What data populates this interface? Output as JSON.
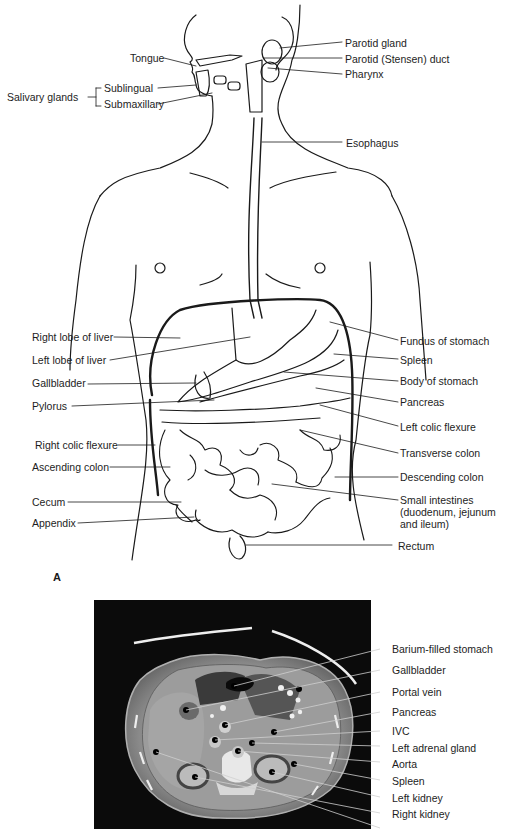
{
  "figure": {
    "panel_a": {
      "letter": "A",
      "left_labels": [
        {
          "id": "tongue",
          "text": "Tongue"
        },
        {
          "id": "salivary-glands",
          "text": "Salivary glands"
        },
        {
          "id": "sublingual",
          "text": "Sublingual"
        },
        {
          "id": "submaxillary",
          "text": "Submaxillary"
        },
        {
          "id": "right-lobe-liver",
          "text": "Right lobe of liver"
        },
        {
          "id": "left-lobe-liver",
          "text": "Left lobe of liver"
        },
        {
          "id": "gallbladder",
          "text": "Gallbladder"
        },
        {
          "id": "pylorus",
          "text": "Pylorus"
        },
        {
          "id": "right-colic-flexure",
          "text": "Right colic flexure"
        },
        {
          "id": "ascending-colon",
          "text": "Ascending colon"
        },
        {
          "id": "cecum",
          "text": "Cecum"
        },
        {
          "id": "appendix",
          "text": "Appendix"
        }
      ],
      "right_labels": [
        {
          "id": "parotid-gland",
          "text": "Parotid gland"
        },
        {
          "id": "parotid-duct",
          "text": "Parotid (Stensen) duct"
        },
        {
          "id": "pharynx",
          "text": "Pharynx"
        },
        {
          "id": "esophagus",
          "text": "Esophagus"
        },
        {
          "id": "fundus-stomach",
          "text": "Fundus of stomach"
        },
        {
          "id": "spleen",
          "text": "Spleen"
        },
        {
          "id": "body-stomach",
          "text": "Body of stomach"
        },
        {
          "id": "pancreas",
          "text": "Pancreas"
        },
        {
          "id": "left-colic-flexure",
          "text": "Left colic flexure"
        },
        {
          "id": "transverse-colon",
          "text": "Transverse colon"
        },
        {
          "id": "descending-colon",
          "text": "Descending colon"
        },
        {
          "id": "small-intestines",
          "text": "Small intestines (duodenum, jejunum and ileum)"
        },
        {
          "id": "rectum",
          "text": "Rectum"
        }
      ]
    },
    "panel_b": {
      "labels": [
        {
          "id": "barium-stomach",
          "text": "Barium-filled stomach"
        },
        {
          "id": "ct-gallbladder",
          "text": "Gallbladder"
        },
        {
          "id": "portal-vein",
          "text": "Portal vein"
        },
        {
          "id": "ct-pancreas",
          "text": "Pancreas"
        },
        {
          "id": "ivc",
          "text": "IVC"
        },
        {
          "id": "left-adrenal",
          "text": "Left adrenal gland"
        },
        {
          "id": "aorta",
          "text": "Aorta"
        },
        {
          "id": "ct-spleen",
          "text": "Spleen"
        },
        {
          "id": "left-kidney",
          "text": "Left kidney"
        },
        {
          "id": "right-kidney",
          "text": "Right kidney"
        }
      ]
    }
  }
}
